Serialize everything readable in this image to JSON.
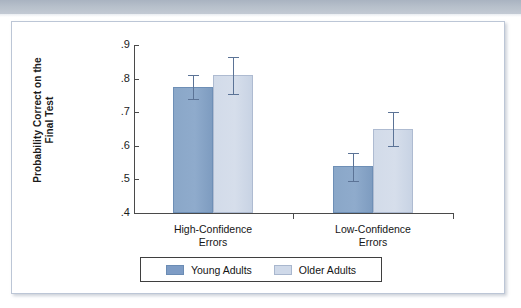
{
  "page": {
    "background_color": "#ffffff",
    "banner_color": "#b3bcc8"
  },
  "figure": {
    "frame_border_color": "#bcc6d6"
  },
  "chart_data": {
    "type": "bar",
    "title": "",
    "xlabel": "",
    "ylabel": "Probability Correct on the Final Test",
    "ylabel_line1": "Probability Correct on the",
    "ylabel_line2": "Final Test",
    "ylim": [
      0.4,
      0.9
    ],
    "yticks": [
      0.4,
      0.5,
      0.6,
      0.7,
      0.8,
      0.9
    ],
    "ytick_labels": [
      ".4",
      ".5",
      ".6",
      ".7",
      ".8",
      ".9"
    ],
    "grid": false,
    "legend_position": "bottom",
    "categories": [
      "High-Confidence Errors",
      "Low-Confidence Errors"
    ],
    "category_lines": [
      [
        "High-Confidence",
        "Errors"
      ],
      [
        "Low-Confidence",
        "Errors"
      ]
    ],
    "series": [
      {
        "name": "Young Adults",
        "color": "#7e9cc5",
        "values": [
          0.775,
          0.54
        ],
        "errors_low": [
          0.74,
          0.495
        ],
        "errors_high": [
          0.81,
          0.578
        ]
      },
      {
        "name": "Older Adults",
        "color": "#cfd9e9",
        "values": [
          0.81,
          0.65
        ],
        "errors_low": [
          0.755,
          0.6
        ],
        "errors_high": [
          0.865,
          0.7
        ]
      }
    ]
  },
  "legend": {
    "items": [
      {
        "label": "Young Adults",
        "color": "#7e9cc5"
      },
      {
        "label": "Older Adults",
        "color": "#cfd9e9"
      }
    ]
  },
  "axis": {
    "tick_0": ".9",
    "tick_1": ".8",
    "tick_2": ".7",
    "tick_3": ".6",
    "tick_4": ".5",
    "tick_5": ".4"
  }
}
